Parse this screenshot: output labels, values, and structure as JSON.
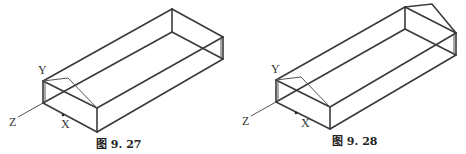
{
  "figures": [
    {
      "id": "fig-9-27",
      "caption": "图 9. 27",
      "axes": {
        "y": "Y",
        "z": "Z",
        "x": "X"
      },
      "gable_ends": 1
    },
    {
      "id": "fig-9-28",
      "caption": "图 9. 28",
      "axes": {
        "y": "Y",
        "z": "Z",
        "x": "X"
      },
      "gable_ends": 2
    }
  ],
  "colors": {
    "line": "#3a3a3a",
    "background": "#ffffff"
  }
}
